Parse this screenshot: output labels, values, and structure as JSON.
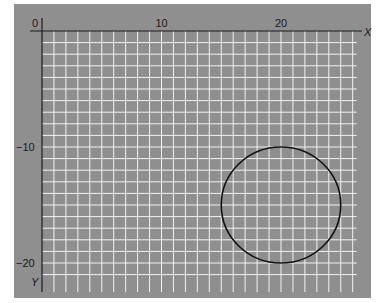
{
  "diagram": {
    "background_color": "#8f8f8f",
    "grid_color": "#f2f2f2",
    "axis_color": "#1a1a1a",
    "axes": {
      "x_label": "X",
      "y_label": "Y",
      "x_ticks": [
        {
          "value": 0,
          "label": "0"
        },
        {
          "value": 10,
          "label": "10"
        },
        {
          "value": 20,
          "label": "20"
        }
      ],
      "y_ticks": [
        {
          "value": -10,
          "label": "−10"
        },
        {
          "value": -20,
          "label": "−20"
        }
      ],
      "x_range": [
        0,
        26
      ],
      "y_range": [
        -22,
        0
      ],
      "grid_step": 1
    },
    "shapes": [
      {
        "type": "circle",
        "center": [
          20,
          -15
        ],
        "radius": 5,
        "stroke": "#111111"
      }
    ]
  }
}
